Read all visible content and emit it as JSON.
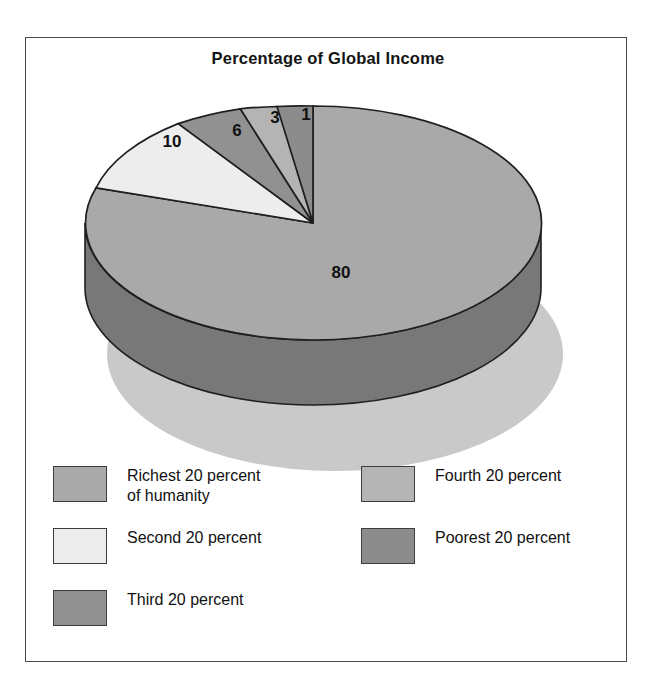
{
  "chart_data": {
    "type": "pie",
    "title": "Percentage of Global Income",
    "categories": [
      "Richest 20 percent of humanity",
      "Second 20 percent",
      "Third 20 percent",
      "Fourth 20 percent",
      "Poorest 20 percent"
    ],
    "values": [
      80,
      10,
      6,
      3,
      1
    ],
    "value_labels": [
      "80",
      "10",
      "6",
      "3",
      "1"
    ],
    "unit": "percent",
    "legend_position": "bottom",
    "grid": false,
    "three_d": true,
    "start_angle_clock": "12 o'clock",
    "direction": "clockwise",
    "slice_colors": [
      "#a9a9a9",
      "#ededed",
      "#919191",
      "#b4b4b4",
      "#8c8c8c"
    ],
    "side_wall_color": "#787878",
    "shadow_color": "#c9c9c9",
    "outline_color": "#1f1f1f"
  },
  "figure": {
    "title": "Percentage of Global Income",
    "frame_color": "#4a4a4a",
    "background": "#ffffff"
  },
  "slice_labels": [
    {
      "text": "80",
      "x": 316,
      "y": 241
    },
    {
      "text": "10",
      "x": 147,
      "y": 110
    },
    {
      "text": "6",
      "x": 212,
      "y": 99
    },
    {
      "text": "3",
      "x": 250,
      "y": 86
    },
    {
      "text": "1",
      "x": 281,
      "y": 83
    }
  ],
  "legend": {
    "left_column": [
      {
        "label": "Richest 20 percent\nof humanity",
        "color": "#a9a9a9",
        "name": "richest-20-percent"
      },
      {
        "label": "Second 20 percent",
        "color": "#ededed",
        "name": "second-20-percent"
      },
      {
        "label": "Third 20 percent",
        "color": "#919191",
        "name": "third-20-percent"
      }
    ],
    "right_column": [
      {
        "label": "Fourth 20 percent",
        "color": "#b4b4b4",
        "name": "fourth-20-percent"
      },
      {
        "label": "Poorest 20 percent",
        "color": "#8c8c8c",
        "name": "poorest-20-percent"
      }
    ]
  }
}
